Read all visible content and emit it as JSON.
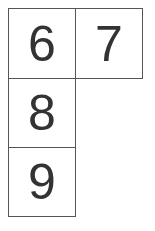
{
  "grid": {
    "cells": [
      {
        "label": "6"
      },
      {
        "label": "7"
      },
      {
        "label": "8"
      },
      {
        "label": "9"
      }
    ]
  },
  "colors": {
    "border": "#555555",
    "text": "#333333",
    "background": "#ffffff"
  }
}
